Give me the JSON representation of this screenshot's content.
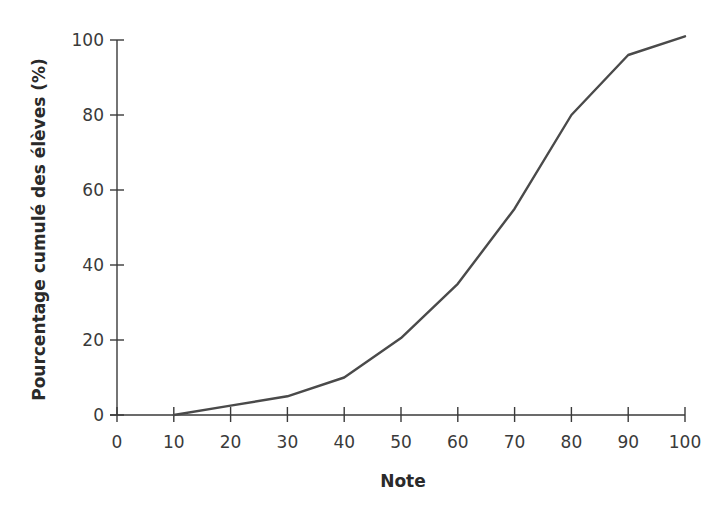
{
  "chart_data": {
    "type": "line",
    "title": "",
    "xlabel": "Note",
    "ylabel": "Pourcentage cumulé des élèves (%)",
    "x": [
      10,
      20,
      30,
      40,
      50,
      60,
      70,
      80,
      90,
      100
    ],
    "series": [
      {
        "name": "Pourcentage cumulé",
        "values": [
          0,
          2.5,
          5,
          10,
          20.5,
          35,
          55,
          80,
          96,
          101
        ]
      }
    ],
    "xlim": [
      0,
      100
    ],
    "ylim": [
      0,
      100
    ],
    "xticks": [
      0,
      10,
      20,
      30,
      40,
      50,
      60,
      70,
      80,
      90,
      100
    ],
    "yticks": [
      0,
      20,
      40,
      60,
      80,
      100
    ],
    "grid": false,
    "legend": null,
    "line_color": "#4a4a4a",
    "axis_color": "#3a3a3a"
  }
}
